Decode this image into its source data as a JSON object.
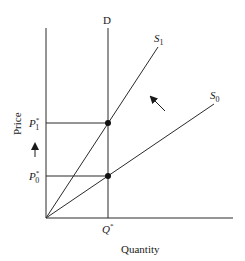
{
  "diagram": {
    "type": "supply-demand",
    "axes": {
      "x_label": "Quantity",
      "y_label": "Price"
    },
    "curves": {
      "demand": {
        "label": "D",
        "kind": "vertical"
      },
      "supply_initial": {
        "label_base": "S",
        "label_sub": "0"
      },
      "supply_shifted": {
        "label_base": "S",
        "label_sub": "1"
      }
    },
    "equilibria": [
      {
        "name": "initial",
        "price_base": "P",
        "price_sup": "*",
        "price_sub": "0"
      },
      {
        "name": "shifted",
        "price_base": "P",
        "price_sup": "*",
        "price_sub": "1"
      }
    ],
    "quantity": {
      "base": "Q",
      "sup": "*"
    },
    "annotations": {
      "shift_arrow": "supply shifts up-left (S0 to S1)",
      "price_arrow": "price rises (P0* to P1*)"
    },
    "colors": {
      "line": "#2a2a2a",
      "text": "#1a1a1a",
      "background": "#ffffff"
    }
  }
}
